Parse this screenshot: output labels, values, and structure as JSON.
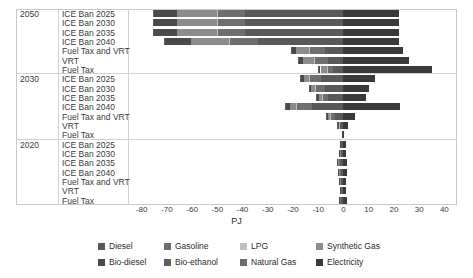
{
  "chart_data": {
    "type": "bar",
    "orientation": "horizontal",
    "stacked": true,
    "diverging": true,
    "title": "",
    "xlabel": "PJ",
    "ylabel": "",
    "xlim": [
      -85,
      45
    ],
    "xticks": [
      -80,
      -70,
      -60,
      -50,
      -40,
      -30,
      -20,
      -10,
      0,
      10,
      20,
      30,
      40
    ],
    "xticklabels": [
      "-80",
      "-70",
      "-60",
      "-50",
      "-40",
      "-30",
      "-20",
      "-10",
      "0",
      "10",
      "20",
      "30",
      "40"
    ],
    "grid": false,
    "legend_position": "bottom",
    "groups": [
      "2050",
      "2030",
      "2020"
    ],
    "categories": [
      "ICE Ban 2025",
      "ICE Ban 2030",
      "ICE Ban 2035",
      "ICE Ban 2040",
      "Fuel Tax and VRT",
      "VRT",
      "Fuel Tax"
    ],
    "series": [
      {
        "name": "Diesel",
        "color": "#595959"
      },
      {
        "name": "Gasoline",
        "color": "#6e6e6e"
      },
      {
        "name": "LPG",
        "color": "#bfbfbf"
      },
      {
        "name": "Synthetic Gas",
        "color": "#8c8c8c"
      },
      {
        "name": "Bio-diesel",
        "color": "#4a4a4a"
      },
      {
        "name": "Bio-ethanol",
        "color": "#5e5e5e"
      },
      {
        "name": "Natural Gas",
        "color": "#6b6b6b"
      },
      {
        "name": "Electricity",
        "color": "#3a3a3a"
      }
    ],
    "rows": [
      {
        "group": "2050",
        "category": "ICE Ban 2025",
        "values": {
          "Diesel": -39.0,
          "Gasoline": -11.0,
          "LPG": -0.3,
          "Synthetic Gas": -15.5,
          "Bio-diesel": -9.5,
          "Bio-ethanol": -0.2,
          "Natural Gas": 0.0,
          "Electricity": 22.0
        }
      },
      {
        "group": "2050",
        "category": "ICE Ban 2030",
        "values": {
          "Diesel": -39.0,
          "Gasoline": -11.0,
          "LPG": -0.3,
          "Synthetic Gas": -15.5,
          "Bio-diesel": -9.5,
          "Bio-ethanol": -0.2,
          "Natural Gas": 0.0,
          "Electricity": 22.0
        }
      },
      {
        "group": "2050",
        "category": "ICE Ban 2035",
        "values": {
          "Diesel": -39.0,
          "Gasoline": -11.0,
          "LPG": -0.3,
          "Synthetic Gas": -15.5,
          "Bio-diesel": -9.5,
          "Bio-ethanol": -0.2,
          "Natural Gas": 0.0,
          "Electricity": 22.0
        }
      },
      {
        "group": "2050",
        "category": "ICE Ban 2040",
        "values": {
          "Diesel": -34.0,
          "Gasoline": -11.0,
          "LPG": -0.3,
          "Synthetic Gas": -15.0,
          "Bio-diesel": -10.5,
          "Bio-ethanol": -0.2,
          "Natural Gas": 0.0,
          "Electricity": 22.0
        }
      },
      {
        "group": "2050",
        "category": "Fuel Tax and VRT",
        "values": {
          "Diesel": -7.5,
          "Gasoline": -6.0,
          "LPG": -0.2,
          "Synthetic Gas": -5.0,
          "Bio-diesel": -2.0,
          "Bio-ethanol": -0.2,
          "Natural Gas": 0.0,
          "Electricity": 23.5
        }
      },
      {
        "group": "2050",
        "category": "VRT",
        "values": {
          "Diesel": -6.0,
          "Gasoline": -5.5,
          "LPG": -0.2,
          "Synthetic Gas": -4.5,
          "Bio-diesel": -1.8,
          "Bio-ethanol": -0.2,
          "Natural Gas": 0.0,
          "Electricity": 26.0
        }
      },
      {
        "group": "2050",
        "category": "Fuel Tax",
        "values": {
          "Diesel": -4.0,
          "Gasoline": -2.5,
          "LPG": -0.1,
          "Synthetic Gas": -2.5,
          "Bio-diesel": -1.0,
          "Bio-ethanol": -0.1,
          "Natural Gas": 0.0,
          "Electricity": 35.0
        }
      },
      {
        "group": "2030",
        "category": "ICE Ban 2025",
        "values": {
          "Diesel": -9.0,
          "Gasoline": -4.5,
          "LPG": -0.2,
          "Synthetic Gas": -2.0,
          "Bio-diesel": -1.5,
          "Bio-ethanol": -0.1,
          "Natural Gas": 0.0,
          "Electricity": 12.5
        }
      },
      {
        "group": "2030",
        "category": "ICE Ban 2030",
        "values": {
          "Diesel": -7.5,
          "Gasoline": -3.5,
          "LPG": -0.2,
          "Synthetic Gas": -1.5,
          "Bio-diesel": -1.0,
          "Bio-ethanol": -0.1,
          "Natural Gas": 0.0,
          "Electricity": 10.0
        }
      },
      {
        "group": "2030",
        "category": "ICE Ban 2035",
        "values": {
          "Diesel": -6.0,
          "Gasoline": -2.5,
          "LPG": -0.1,
          "Synthetic Gas": -1.2,
          "Bio-diesel": -0.8,
          "Bio-ethanol": -0.1,
          "Natural Gas": 0.0,
          "Electricity": 9.0
        }
      },
      {
        "group": "2030",
        "category": "ICE Ban 2040",
        "values": {
          "Diesel": -12.5,
          "Gasoline": -6.0,
          "LPG": -0.2,
          "Synthetic Gas": -2.5,
          "Bio-diesel": -2.0,
          "Bio-ethanol": -0.1,
          "Natural Gas": 0.0,
          "Electricity": 22.5
        }
      },
      {
        "group": "2030",
        "category": "Fuel Tax and VRT",
        "values": {
          "Diesel": -3.5,
          "Gasoline": -1.8,
          "LPG": -0.1,
          "Synthetic Gas": -0.8,
          "Bio-diesel": -0.6,
          "Bio-ethanol": -0.1,
          "Natural Gas": 0.0,
          "Electricity": 4.5
        }
      },
      {
        "group": "2030",
        "category": "VRT",
        "values": {
          "Diesel": -1.2,
          "Gasoline": -0.6,
          "LPG": -0.05,
          "Synthetic Gas": -0.3,
          "Bio-diesel": -0.2,
          "Bio-ethanol": -0.05,
          "Natural Gas": 0.0,
          "Electricity": 1.8
        }
      },
      {
        "group": "2030",
        "category": "Fuel Tax",
        "values": {
          "Diesel": -0.3,
          "Gasoline": -0.15,
          "LPG": 0.0,
          "Synthetic Gas": -0.1,
          "Bio-diesel": -0.05,
          "Bio-ethanol": 0.0,
          "Natural Gas": 0.0,
          "Electricity": 0.4
        }
      },
      {
        "group": "2020",
        "category": "ICE Ban 2025",
        "values": {
          "Diesel": -0.8,
          "Gasoline": -0.4,
          "LPG": 0.0,
          "Synthetic Gas": -0.2,
          "Bio-diesel": -0.1,
          "Bio-ethanol": 0.0,
          "Natural Gas": 0.0,
          "Electricity": 1.1
        }
      },
      {
        "group": "2020",
        "category": "ICE Ban 2030",
        "values": {
          "Diesel": -0.9,
          "Gasoline": -0.4,
          "LPG": 0.0,
          "Synthetic Gas": -0.2,
          "Bio-diesel": -0.1,
          "Bio-ethanol": 0.0,
          "Natural Gas": 0.0,
          "Electricity": 1.2
        }
      },
      {
        "group": "2020",
        "category": "ICE Ban 2035",
        "values": {
          "Diesel": -1.3,
          "Gasoline": -0.6,
          "LPG": 0.0,
          "Synthetic Gas": -0.3,
          "Bio-diesel": -0.2,
          "Bio-ethanol": 0.0,
          "Natural Gas": 0.0,
          "Electricity": 1.6
        }
      },
      {
        "group": "2020",
        "category": "ICE Ban 2040",
        "values": {
          "Diesel": -1.1,
          "Gasoline": -0.5,
          "LPG": 0.0,
          "Synthetic Gas": -0.3,
          "Bio-diesel": -0.2,
          "Bio-ethanol": 0.0,
          "Natural Gas": 0.0,
          "Electricity": 1.4
        }
      },
      {
        "group": "2020",
        "category": "Fuel Tax and VRT",
        "values": {
          "Diesel": -0.9,
          "Gasoline": -0.4,
          "LPG": 0.0,
          "Synthetic Gas": -0.2,
          "Bio-diesel": -0.1,
          "Bio-ethanol": 0.0,
          "Natural Gas": 0.0,
          "Electricity": 1.2
        }
      },
      {
        "group": "2020",
        "category": "VRT",
        "values": {
          "Diesel": -0.7,
          "Gasoline": -0.3,
          "LPG": 0.0,
          "Synthetic Gas": -0.2,
          "Bio-diesel": -0.1,
          "Bio-ethanol": 0.0,
          "Natural Gas": 0.0,
          "Electricity": 1.0
        }
      },
      {
        "group": "2020",
        "category": "Fuel Tax",
        "values": {
          "Diesel": -1.0,
          "Gasoline": -0.5,
          "LPG": 0.0,
          "Synthetic Gas": -0.2,
          "Bio-diesel": -0.1,
          "Bio-ethanol": 0.0,
          "Natural Gas": 0.0,
          "Electricity": 1.3
        }
      }
    ],
    "legend": [
      "Diesel",
      "Gasoline",
      "LPG",
      "Synthetic Gas",
      "Bio-diesel",
      "Bio-ethanol",
      "Natural Gas",
      "Electricity"
    ]
  }
}
